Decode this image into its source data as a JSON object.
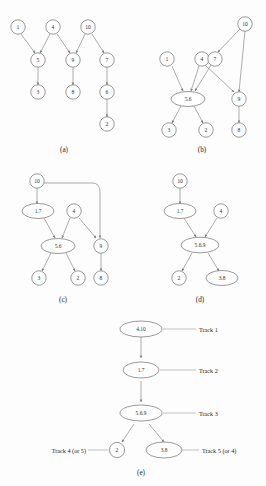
{
  "figure": {
    "background_color": "#fdfdfd",
    "stroke_color": "#6e6e6e",
    "edge_color": "#8a8a8a",
    "text_color": "#1d1d1d"
  },
  "panels": [
    {
      "id": "a",
      "caption": "(a)",
      "nodes": [
        {
          "id": "a1",
          "label": "1",
          "shape": "circle"
        },
        {
          "id": "a4",
          "label": "4",
          "shape": "circle"
        },
        {
          "id": "a10",
          "label": "10",
          "shape": "circle"
        },
        {
          "id": "a5",
          "label": "5",
          "shape": "circle"
        },
        {
          "id": "a9",
          "label": "9",
          "shape": "circle"
        },
        {
          "id": "a7",
          "label": "7",
          "shape": "circle"
        },
        {
          "id": "a3",
          "label": "3",
          "shape": "circle"
        },
        {
          "id": "a8",
          "label": "8",
          "shape": "circle"
        },
        {
          "id": "a6",
          "label": "6",
          "shape": "circle"
        },
        {
          "id": "a2",
          "label": "2",
          "shape": "circle"
        }
      ],
      "edges": [
        {
          "from": "1",
          "to": "5"
        },
        {
          "from": "4",
          "to": "5"
        },
        {
          "from": "4",
          "to": "9"
        },
        {
          "from": "10",
          "to": "9"
        },
        {
          "from": "10",
          "to": "7"
        },
        {
          "from": "5",
          "to": "3"
        },
        {
          "from": "9",
          "to": "8"
        },
        {
          "from": "7",
          "to": "6"
        },
        {
          "from": "6",
          "to": "2"
        }
      ]
    },
    {
      "id": "b",
      "caption": "(b)",
      "nodes": [
        {
          "id": "b10",
          "label": "10",
          "shape": "circle"
        },
        {
          "id": "b1",
          "label": "1",
          "shape": "circle"
        },
        {
          "id": "b4",
          "label": "4",
          "shape": "circle"
        },
        {
          "id": "b7",
          "label": "7",
          "shape": "circle"
        },
        {
          "id": "b56",
          "label": "5.6",
          "shape": "ellipse"
        },
        {
          "id": "b9",
          "label": "9",
          "shape": "circle"
        },
        {
          "id": "b3",
          "label": "3",
          "shape": "circle"
        },
        {
          "id": "b2",
          "label": "2",
          "shape": "circle"
        },
        {
          "id": "b8",
          "label": "8",
          "shape": "circle"
        }
      ],
      "edges": [
        {
          "from": "10",
          "to": "7"
        },
        {
          "from": "10",
          "to": "9"
        },
        {
          "from": "1",
          "to": "5.6"
        },
        {
          "from": "4",
          "to": "5.6"
        },
        {
          "from": "4",
          "to": "9"
        },
        {
          "from": "7",
          "to": "5.6"
        },
        {
          "from": "5.6",
          "to": "3"
        },
        {
          "from": "5.6",
          "to": "2"
        },
        {
          "from": "9",
          "to": "8"
        }
      ]
    },
    {
      "id": "c",
      "caption": "(c)",
      "nodes": [
        {
          "id": "c10",
          "label": "10",
          "shape": "circle"
        },
        {
          "id": "c17",
          "label": "1.7",
          "shape": "ellipse"
        },
        {
          "id": "c4",
          "label": "4",
          "shape": "circle"
        },
        {
          "id": "c56",
          "label": "5.6",
          "shape": "ellipse"
        },
        {
          "id": "c9",
          "label": "9",
          "shape": "circle"
        },
        {
          "id": "c3",
          "label": "3",
          "shape": "circle"
        },
        {
          "id": "c2",
          "label": "2",
          "shape": "circle"
        },
        {
          "id": "c8",
          "label": "8",
          "shape": "circle"
        }
      ],
      "edges": [
        {
          "from": "10",
          "to": "1.7"
        },
        {
          "from": "10",
          "to": "9",
          "style": "curved"
        },
        {
          "from": "1.7",
          "to": "5.6"
        },
        {
          "from": "4",
          "to": "5.6"
        },
        {
          "from": "4",
          "to": "9"
        },
        {
          "from": "5.6",
          "to": "3"
        },
        {
          "from": "5.6",
          "to": "2"
        },
        {
          "from": "9",
          "to": "8"
        }
      ]
    },
    {
      "id": "d",
      "caption": "(d)",
      "nodes": [
        {
          "id": "d10",
          "label": "10",
          "shape": "circle"
        },
        {
          "id": "d17",
          "label": "1.7",
          "shape": "ellipse"
        },
        {
          "id": "d4",
          "label": "4",
          "shape": "circle"
        },
        {
          "id": "d569",
          "label": "5.6.9",
          "shape": "ellipse"
        },
        {
          "id": "d2",
          "label": "2",
          "shape": "circle"
        },
        {
          "id": "d38",
          "label": "3.8",
          "shape": "ellipse"
        }
      ],
      "edges": [
        {
          "from": "10",
          "to": "1.7"
        },
        {
          "from": "1.7",
          "to": "5.6.9"
        },
        {
          "from": "4",
          "to": "5.6.9"
        },
        {
          "from": "5.6.9",
          "to": "2"
        },
        {
          "from": "5.6.9",
          "to": "3.8"
        }
      ]
    },
    {
      "id": "e",
      "caption": "(e)",
      "nodes": [
        {
          "id": "e410",
          "label": "4.10",
          "shape": "ellipse"
        },
        {
          "id": "e17",
          "label": "1.7",
          "shape": "ellipse"
        },
        {
          "id": "e569",
          "label": "5.6.9",
          "shape": "ellipse"
        },
        {
          "id": "e2",
          "label": "2",
          "shape": "circle"
        },
        {
          "id": "e38",
          "label": "3.8",
          "shape": "ellipse"
        }
      ],
      "edges": [
        {
          "from": "4.10",
          "to": "1.7"
        },
        {
          "from": "1.7",
          "to": "5.6.9"
        },
        {
          "from": "5.6.9",
          "to": "2"
        },
        {
          "from": "5.6.9",
          "to": "3.8"
        }
      ],
      "tracks": [
        {
          "id": "track1",
          "label": "Track 1",
          "side": "right",
          "node": "4.10"
        },
        {
          "id": "track2",
          "label": "Track 2",
          "side": "right",
          "node": "1.7"
        },
        {
          "id": "track3",
          "label": "Track 3",
          "side": "right",
          "node": "5.6.9"
        },
        {
          "id": "track4",
          "label": "Track 4 (or 5)",
          "side": "left",
          "node": "2"
        },
        {
          "id": "track5",
          "label": "Track 5 (or 4)",
          "side": "right",
          "node": "3.8"
        }
      ]
    }
  ]
}
